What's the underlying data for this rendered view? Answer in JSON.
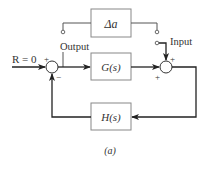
{
  "diagram": {
    "type": "block-diagram",
    "caption": "(a)",
    "colors": {
      "line": "#333333",
      "box_border": "#888888",
      "background": "#ffffff"
    },
    "blocks": [
      {
        "id": "delta_a",
        "label": "Δa"
      },
      {
        "id": "G",
        "label": "G(s)"
      },
      {
        "id": "H",
        "label": "H(s)"
      }
    ],
    "labels": {
      "reference": "R = 0",
      "output": "Output",
      "input": "Input"
    },
    "summing_junctions": [
      {
        "id": "sum_left",
        "signs": {
          "top": "+",
          "bottom": "−"
        }
      },
      {
        "id": "sum_right",
        "signs": {
          "top": "+",
          "left": "+"
        }
      }
    ]
  }
}
